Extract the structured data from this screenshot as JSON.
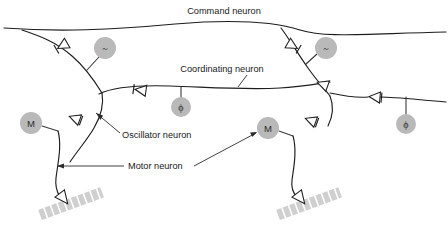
{
  "figure": {
    "background_color": "#ffffff",
    "line_color": "#1d1d1d",
    "soma_fill_color": "#b9b9b9",
    "muscle_fill_color": "#cfcfcf",
    "width": 448,
    "height": 240
  },
  "labels": {
    "command_neuron": "Command neuron",
    "coordinating_neuron": "Coordinating neuron",
    "oscillator_neuron": "Oscillator neuron",
    "motor_neuron": "Motor neuron"
  },
  "somata": [
    {
      "id": "osc-left",
      "glyph": "~",
      "kind": "oscillator",
      "cx": 105,
      "cy": 48,
      "r": 11
    },
    {
      "id": "osc-right",
      "glyph": "~",
      "kind": "oscillator",
      "cx": 326,
      "cy": 48,
      "r": 11
    },
    {
      "id": "coord-mid",
      "glyph": "ϕ",
      "kind": "coordinating",
      "cx": 181,
      "cy": 107,
      "r": 10
    },
    {
      "id": "coord-right",
      "glyph": "ϕ",
      "kind": "coordinating",
      "cx": 406,
      "cy": 124,
      "r": 10
    },
    {
      "id": "motor-left",
      "glyph": "M",
      "kind": "motor",
      "cx": 31,
      "cy": 123,
      "r": 11
    },
    {
      "id": "motor-right",
      "glyph": "M",
      "kind": "motor",
      "cx": 268,
      "cy": 128,
      "r": 11
    }
  ],
  "synapses": [
    {
      "id": "syn-cmd-left",
      "x": 62,
      "y": 46,
      "rotation": 150
    },
    {
      "id": "syn-cmd-right",
      "x": 293,
      "y": 46,
      "rotation": 30
    },
    {
      "id": "syn-coord-left",
      "x": 140,
      "y": 90,
      "rotation": 188
    },
    {
      "id": "syn-coord-right",
      "x": 310,
      "y": 83,
      "rotation": 8
    },
    {
      "id": "syn-coord-far-right",
      "x": 368,
      "y": 97,
      "rotation": 185
    },
    {
      "id": "syn-motor-left",
      "x": 76,
      "y": 118,
      "rotation": 200
    },
    {
      "id": "syn-motor-right",
      "x": 312,
      "y": 120,
      "rotation": 198
    },
    {
      "id": "syn-nmj-left",
      "x": 62,
      "y": 196,
      "rotation": 45
    },
    {
      "id": "syn-nmj-right",
      "x": 300,
      "y": 196,
      "rotation": 45
    }
  ],
  "muscles": [
    {
      "id": "muscle-left",
      "x": 44,
      "y": 202,
      "length": 62,
      "angle": -20
    },
    {
      "id": "muscle-right",
      "x": 282,
      "y": 202,
      "length": 62,
      "angle": -20
    }
  ],
  "counts": {
    "somata": 6,
    "synapses": 9,
    "muscles": 2,
    "labels": 4
  }
}
